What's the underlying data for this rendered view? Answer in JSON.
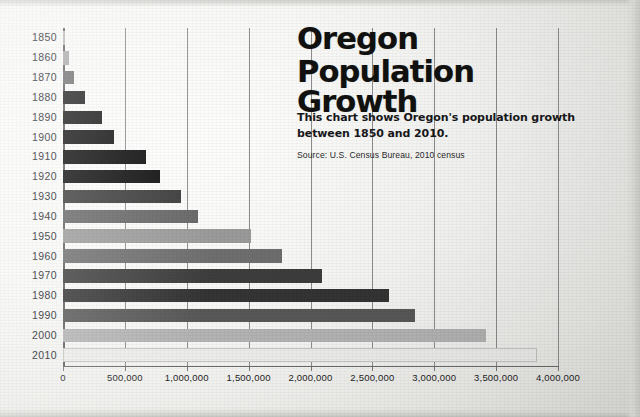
{
  "title": {
    "line1": "Oregon",
    "line2": "Population Growth"
  },
  "deck": "This chart shows Oregon's population growth between 1850 and 2010.",
  "source": "Source: U.S. Census Bureau, 2010 census",
  "chart_data": {
    "type": "bar",
    "orientation": "horizontal",
    "title": "Oregon Population Growth",
    "subtitle": "This chart shows Oregon's population growth between 1850 and 2010.",
    "source": "Source: U.S. Census Bureau, 2010 census",
    "xlabel": "",
    "ylabel": "",
    "xlim": [
      0,
      4000000
    ],
    "grid": true,
    "legend": false,
    "categories": [
      "1850",
      "1860",
      "1870",
      "1880",
      "1890",
      "1900",
      "1910",
      "1920",
      "1930",
      "1940",
      "1950",
      "1960",
      "1970",
      "1980",
      "1990",
      "2000",
      "2010"
    ],
    "values": [
      12000,
      52000,
      91000,
      175000,
      318000,
      414000,
      673000,
      783000,
      954000,
      1090000,
      1521000,
      1769000,
      2092000,
      2633000,
      2842000,
      3421000,
      3831000
    ],
    "xticks": [
      0,
      500000,
      1000000,
      1500000,
      2000000,
      2500000,
      3000000,
      3500000,
      4000000
    ],
    "xtick_labels": [
      "0",
      "500,000",
      "1,000,000",
      "1,500,000",
      "2,000,000",
      "2,500,000",
      "3,000,000",
      "3,500,000",
      "4,000,000"
    ],
    "bar_colors": [
      "#b9b9b9",
      "#a9a9a9",
      "#6f6f6f",
      "#1d1d1d",
      "#161616",
      "#111111",
      "#090909",
      "#0b0b0b",
      "#3a3a3a",
      "#666666",
      "#9a9a9a",
      "#6e6e6e",
      "#3d3d3d",
      "#343434",
      "#585858",
      "#b3b3b3",
      "#ececea"
    ],
    "axis_color": "#5e5e5e",
    "grid_color": "#8d8d8d",
    "background": "#f5f5f3"
  }
}
